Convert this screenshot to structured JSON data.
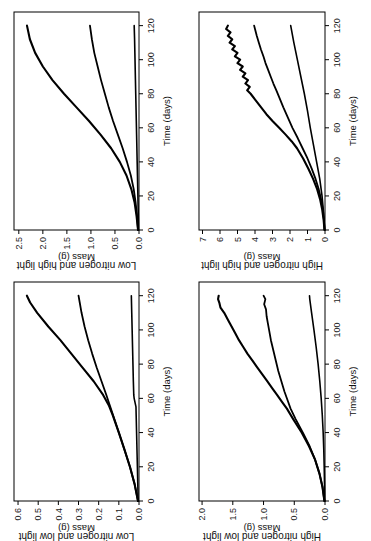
{
  "figure": {
    "background": "#ffffff",
    "orientation": "rotated-90-ccw",
    "line_color": "#000000",
    "panel_count": 4
  },
  "chart_data": [
    {
      "type": "line",
      "panel_position": "top-left",
      "title": "Low nitrogen and high light",
      "xlabel": "Time (days)",
      "ylabel": "Mass (g)",
      "xlim": [
        0,
        128
      ],
      "ylim": [
        0.0,
        2.6
      ],
      "xticks": [
        0,
        20,
        40,
        60,
        80,
        100,
        120
      ],
      "xticklabels": [
        "0",
        "20",
        "40",
        "60",
        "80",
        "100",
        "120"
      ],
      "yticks": [
        0.0,
        0.5,
        1.0,
        1.5,
        2.0,
        2.5
      ],
      "yticklabels": [
        "0.0",
        "0.5",
        "1.0",
        "1.5",
        "2.0",
        "2.5"
      ],
      "grid": false,
      "legend": "none",
      "series": [
        {
          "name": "upper-curve",
          "x": [
            0,
            8,
            16,
            24,
            32,
            40,
            48,
            56,
            64,
            72,
            80,
            88,
            96,
            104,
            112,
            120
          ],
          "y": [
            0.02,
            0.05,
            0.09,
            0.16,
            0.26,
            0.4,
            0.58,
            0.8,
            1.04,
            1.3,
            1.56,
            1.8,
            2.0,
            2.16,
            2.27,
            2.33
          ]
        },
        {
          "name": "middle-curve",
          "x": [
            0,
            8,
            16,
            24,
            32,
            40,
            48,
            56,
            64,
            72,
            80,
            88,
            96,
            104,
            112,
            120
          ],
          "y": [
            0.02,
            0.04,
            0.07,
            0.11,
            0.17,
            0.25,
            0.34,
            0.44,
            0.54,
            0.63,
            0.71,
            0.79,
            0.86,
            0.93,
            0.98,
            1.02
          ]
        },
        {
          "name": "lower-curve",
          "x": [
            0,
            8,
            16,
            24,
            32,
            40,
            48,
            56,
            64,
            72,
            80,
            88,
            96,
            104,
            112,
            120
          ],
          "y": [
            0.01,
            0.015,
            0.02,
            0.026,
            0.032,
            0.038,
            0.044,
            0.05,
            0.056,
            0.062,
            0.068,
            0.074,
            0.08,
            0.086,
            0.092,
            0.1
          ]
        }
      ]
    },
    {
      "type": "line",
      "panel_position": "top-right",
      "title": "High nitrogen and high light",
      "xlabel": "Time (days)",
      "ylabel": "Mass (g)",
      "xlim": [
        0,
        128
      ],
      "ylim": [
        0,
        7.2
      ],
      "xticks": [
        0,
        20,
        40,
        60,
        80,
        100,
        120
      ],
      "xticklabels": [
        "0",
        "20",
        "40",
        "60",
        "80",
        "100",
        "120"
      ],
      "yticks": [
        0,
        1,
        2,
        3,
        4,
        5,
        6,
        7
      ],
      "yticklabels": [
        "0",
        "1",
        "2",
        "3",
        "4",
        "5",
        "6",
        "7"
      ],
      "grid": false,
      "legend": "none",
      "series": [
        {
          "name": "upper-curve",
          "x": [
            0,
            6,
            12,
            18,
            24,
            30,
            36,
            42,
            48,
            52,
            56,
            60,
            64,
            68,
            72,
            76,
            80,
            82,
            84,
            86,
            88,
            90,
            92,
            94,
            96,
            98,
            100,
            102,
            104,
            106,
            108,
            110,
            112,
            114,
            116,
            118,
            120
          ],
          "y": [
            0.03,
            0.08,
            0.16,
            0.28,
            0.45,
            0.68,
            0.95,
            1.25,
            1.6,
            1.9,
            2.25,
            2.62,
            3.0,
            3.35,
            3.65,
            3.95,
            4.25,
            4.45,
            4.3,
            4.55,
            4.4,
            4.7,
            4.55,
            4.85,
            4.7,
            5.0,
            4.85,
            5.15,
            5.0,
            5.3,
            5.15,
            5.45,
            5.3,
            5.55,
            5.4,
            5.65,
            5.55
          ]
        },
        {
          "name": "middle-curve",
          "x": [
            0,
            6,
            12,
            18,
            24,
            30,
            36,
            42,
            48,
            54,
            60,
            66,
            72,
            78,
            82,
            86,
            90,
            94,
            98,
            102,
            106,
            110,
            114,
            118,
            120
          ],
          "y": [
            0.02,
            0.06,
            0.12,
            0.22,
            0.36,
            0.54,
            0.76,
            1.0,
            1.28,
            1.56,
            1.86,
            2.12,
            2.38,
            2.62,
            2.78,
            2.95,
            3.1,
            3.25,
            3.4,
            3.52,
            3.66,
            3.78,
            3.9,
            4.0,
            4.05
          ]
        },
        {
          "name": "lower-curve",
          "x": [
            0,
            10,
            20,
            30,
            40,
            50,
            60,
            70,
            80,
            90,
            100,
            110,
            120
          ],
          "y": [
            0.02,
            0.08,
            0.17,
            0.3,
            0.48,
            0.66,
            0.84,
            1.0,
            1.18,
            1.38,
            1.58,
            1.78,
            1.96
          ]
        }
      ]
    },
    {
      "type": "line",
      "panel_position": "bottom-left",
      "title": "Low nitrogen and low light",
      "xlabel": "Time (days)",
      "ylabel": "Mass (g)",
      "xlim": [
        0,
        128
      ],
      "ylim": [
        0.0,
        0.62
      ],
      "xticks": [
        0,
        20,
        40,
        60,
        80,
        100,
        120
      ],
      "xticklabels": [
        "0",
        "20",
        "40",
        "60",
        "80",
        "100",
        "120"
      ],
      "yticks": [
        0.0,
        0.1,
        0.2,
        0.3,
        0.4,
        0.5,
        0.6
      ],
      "yticklabels": [
        "0.0",
        "0.1",
        "0.2",
        "0.3",
        "0.4",
        "0.5",
        "0.6"
      ],
      "grid": false,
      "legend": "none",
      "series": [
        {
          "name": "upper-curve",
          "x": [
            0,
            10,
            20,
            30,
            40,
            50,
            56,
            62,
            70,
            78,
            86,
            94,
            102,
            110,
            116,
            120
          ],
          "y": [
            0.005,
            0.022,
            0.045,
            0.072,
            0.1,
            0.13,
            0.15,
            0.178,
            0.225,
            0.28,
            0.335,
            0.39,
            0.45,
            0.505,
            0.54,
            0.556
          ]
        },
        {
          "name": "middle-curve",
          "x": [
            0,
            10,
            20,
            30,
            40,
            50,
            56,
            62,
            70,
            78,
            86,
            94,
            102,
            110,
            116,
            120
          ],
          "y": [
            0.005,
            0.022,
            0.045,
            0.072,
            0.1,
            0.128,
            0.145,
            0.162,
            0.186,
            0.21,
            0.232,
            0.252,
            0.27,
            0.285,
            0.294,
            0.3
          ]
        },
        {
          "name": "lower-curve",
          "x": [
            0,
            10,
            20,
            30,
            40,
            50,
            55,
            60,
            62,
            70,
            80,
            90,
            100,
            110,
            120
          ],
          "y": [
            0.004,
            0.006,
            0.008,
            0.01,
            0.012,
            0.014,
            0.015,
            0.024,
            0.026,
            0.028,
            0.03,
            0.032,
            0.034,
            0.036,
            0.038
          ]
        }
      ]
    },
    {
      "type": "line",
      "panel_position": "bottom-right",
      "title": "High nitrogen and low light",
      "xlabel": "Time (days)",
      "ylabel": "Mass (g)",
      "xlim": [
        0,
        128
      ],
      "ylim": [
        0.0,
        2.05
      ],
      "xticks": [
        0,
        20,
        40,
        60,
        80,
        100,
        120
      ],
      "xticklabels": [
        "0",
        "20",
        "40",
        "60",
        "80",
        "100",
        "120"
      ],
      "yticks": [
        0.0,
        0.5,
        1.0,
        1.5,
        2.0
      ],
      "yticklabels": [
        "0.0",
        "0.5",
        "1.0",
        "1.5",
        "2.0"
      ],
      "grid": false,
      "legend": "none",
      "series": [
        {
          "name": "upper-curve",
          "x": [
            0,
            8,
            16,
            24,
            32,
            40,
            48,
            54,
            58,
            62,
            66,
            70,
            74,
            78,
            82,
            86,
            90,
            94,
            98,
            102,
            106,
            110,
            113,
            116,
            118,
            120
          ],
          "y": [
            0.01,
            0.04,
            0.09,
            0.16,
            0.26,
            0.38,
            0.52,
            0.62,
            0.7,
            0.78,
            0.86,
            0.94,
            1.02,
            1.1,
            1.18,
            1.26,
            1.33,
            1.4,
            1.46,
            1.52,
            1.58,
            1.64,
            1.7,
            1.72,
            1.74,
            1.73
          ]
        },
        {
          "name": "middle-curve",
          "x": [
            0,
            8,
            16,
            24,
            32,
            40,
            48,
            54,
            58,
            64,
            70,
            76,
            82,
            88,
            94,
            100,
            104,
            108,
            112,
            115,
            118,
            120
          ],
          "y": [
            0.01,
            0.04,
            0.09,
            0.16,
            0.25,
            0.36,
            0.48,
            0.56,
            0.6,
            0.66,
            0.71,
            0.76,
            0.8,
            0.84,
            0.88,
            0.91,
            0.93,
            0.95,
            0.96,
            0.99,
            0.97,
            1.0
          ]
        },
        {
          "name": "lower-curve",
          "x": [
            0,
            10,
            20,
            30,
            40,
            50,
            60,
            70,
            80,
            90,
            100,
            110,
            118,
            120
          ],
          "y": [
            0.004,
            0.008,
            0.013,
            0.02,
            0.03,
            0.044,
            0.062,
            0.085,
            0.112,
            0.144,
            0.18,
            0.218,
            0.248,
            0.252
          ]
        }
      ]
    }
  ]
}
